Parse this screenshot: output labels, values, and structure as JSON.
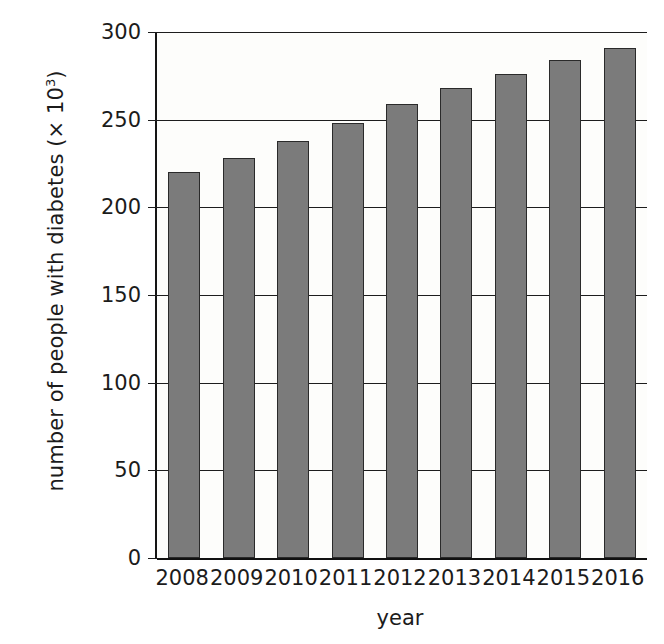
{
  "chart_data": {
    "type": "bar",
    "title": "",
    "categories": [
      "2008",
      "2009",
      "2010",
      "2011",
      "2012",
      "2013",
      "2014",
      "2015",
      "2016"
    ],
    "values": [
      220,
      228,
      238,
      248,
      259,
      268,
      276,
      284,
      291
    ],
    "series": [
      {
        "name": "number of people with diabetes",
        "values": [
          220,
          228,
          238,
          248,
          259,
          268,
          276,
          284,
          291
        ]
      }
    ],
    "xlabel": "year",
    "ylabel": "number of people with diabetes (× 10³)",
    "ylabel_prefix": "number of people with diabetes (× 10",
    "ylabel_exponent": "3",
    "ylabel_suffix": ")",
    "ylim": [
      0,
      300
    ],
    "xlim_categories": 9,
    "yticks": [
      0,
      50,
      100,
      150,
      200,
      250,
      300
    ],
    "ytick_labels": [
      "0",
      "50",
      "100",
      "150",
      "200",
      "250",
      "300"
    ],
    "grid": "horizontal",
    "legend": "none",
    "bar_color": "#7b7b7b",
    "bar_edge_color": "#2a2a2a",
    "axis_color": "#1b1b1b",
    "plot_background": "#fdfdfb",
    "units": "thousands of people"
  },
  "axes": {
    "y_title": "number of people with diabetes (× 10³)",
    "x_title": "year"
  }
}
